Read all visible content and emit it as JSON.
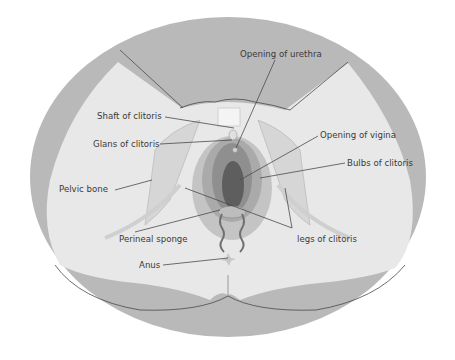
{
  "diagram": {
    "type": "anatomical-illustration",
    "colors": {
      "background": "#ffffff",
      "outer_ellipse": "#b9b9b9",
      "thigh_light": "#e8e8e8",
      "vulva_outer": "#c4c4c4",
      "labia": "#9e9e9e",
      "vaginal_opening": "#5e5e5e",
      "line": "#555555",
      "text": "#3a3a3a"
    },
    "labels": [
      {
        "id": "opening-of-urethra",
        "text": "Opening of urethra"
      },
      {
        "id": "shaft-of-clitoris",
        "text": "Shaft of clitoris"
      },
      {
        "id": "glans-of-clitoris",
        "text": "Glans of clitoris"
      },
      {
        "id": "opening-of-vigina",
        "text": "Opening of vigina"
      },
      {
        "id": "bulbs-of-clitoris",
        "text": "Bulbs of clitoris"
      },
      {
        "id": "pelvic-bone",
        "text": "Pelvic bone"
      },
      {
        "id": "perineal-sponge",
        "text": "Perineal sponge"
      },
      {
        "id": "legs-of-clitoris",
        "text": "legs of clitoris"
      },
      {
        "id": "anus",
        "text": "Anus"
      }
    ]
  }
}
